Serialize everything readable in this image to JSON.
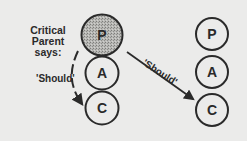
{
  "speaker_label": {
    "line1": "Critical",
    "line2": "Parent says:"
  },
  "arrow_left_label": "'Should'",
  "arrow_right_label": "'Should'",
  "left_stack": [
    {
      "letter": "P",
      "shaded": true
    },
    {
      "letter": "A",
      "shaded": false
    },
    {
      "letter": "C",
      "shaded": false
    }
  ],
  "right_stack": [
    {
      "letter": "P",
      "shaded": false
    },
    {
      "letter": "A",
      "shaded": false
    },
    {
      "letter": "C",
      "shaded": false
    }
  ],
  "colors": {
    "background": "#ebebea",
    "ink": "#2a2a2a",
    "shade": "#a9a9a6"
  }
}
